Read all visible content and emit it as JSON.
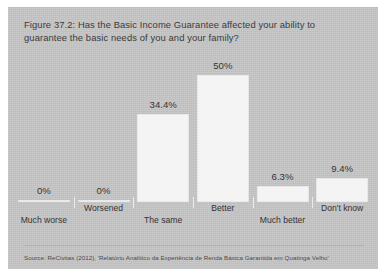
{
  "figure": {
    "title": "Figure 37.2: Has the Basic Income Guarantee affected your ability to guarantee the basic needs of you and your family?",
    "source": "Source: ReCivitas (2012), 'Relatório Analítico da Experiência de Renda Básica Garantida em Quatinga Velho'",
    "panel_color": "#c7c7c7",
    "bar_color": "#f4f4f4",
    "text_color": "#3b3b3b"
  },
  "chart_data": {
    "type": "bar",
    "title": "Figure 37.2: Has the Basic Income Guarantee affected your ability to guarantee the basic needs of you and your family?",
    "xlabel": "",
    "ylabel": "",
    "ylim": [
      0,
      55
    ],
    "grid": false,
    "legend": false,
    "categories": [
      "Much worse",
      "Worsened",
      "The same",
      "Better",
      "Much better",
      "Don't know"
    ],
    "values": [
      0,
      0,
      34.4,
      50,
      6.3,
      9.4
    ],
    "value_labels": [
      "0%",
      "0%",
      "34.4%",
      "50%",
      "6.3%",
      "9.4%"
    ],
    "label_rows": [
      "down",
      "up",
      "down",
      "up",
      "down",
      "up"
    ],
    "source": "Source: ReCivitas (2012), 'Relatório Analítico da Experiência de Renda Básica Garantida em Quatinga Velho'"
  }
}
